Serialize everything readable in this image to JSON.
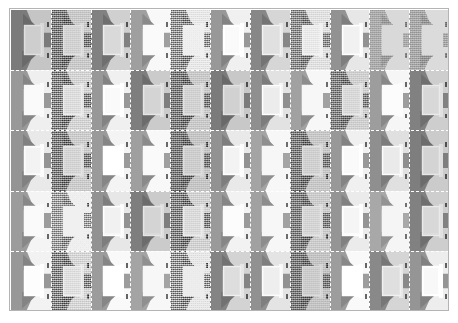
{
  "figure": {
    "type": "image-grid-montage",
    "rows": 5,
    "columns": 11,
    "total_tiles": 55,
    "frame_color": "#b4b4b4",
    "separator_color": "#ffffff",
    "separator_style": "dashed",
    "background_color": "#ffffff",
    "colorspace": "grayscale",
    "scene_description": "repeated indoor scene patch: bright rectangular panel on gray wall with light wedges and sloped shadows"
  },
  "tiles": [
    [
      {
        "brightness": 0.86,
        "contrast": 1.04,
        "noise": 0.0
      },
      {
        "brightness": 0.92,
        "contrast": 0.92,
        "noise": 0.85
      },
      {
        "brightness": 0.9,
        "contrast": 1.06,
        "noise": 0.0
      },
      {
        "brightness": 1.12,
        "contrast": 0.96,
        "noise": 0.0
      },
      {
        "brightness": 1.1,
        "contrast": 0.88,
        "noise": 0.8
      },
      {
        "brightness": 1.06,
        "contrast": 1.0,
        "noise": 0.0
      },
      {
        "brightness": 0.94,
        "contrast": 1.02,
        "noise": 0.0
      },
      {
        "brightness": 1.04,
        "contrast": 0.9,
        "noise": 0.7
      },
      {
        "brightness": 1.02,
        "contrast": 1.0,
        "noise": 0.0
      },
      {
        "brightness": 1.34,
        "contrast": 0.7,
        "noise": 0.25
      },
      {
        "brightness": 1.3,
        "contrast": 0.72,
        "noise": 0.3
      }
    ],
    [
      {
        "brightness": 1.08,
        "contrast": 0.96,
        "noise": 0.0
      },
      {
        "brightness": 0.98,
        "contrast": 0.9,
        "noise": 0.88
      },
      {
        "brightness": 1.06,
        "contrast": 1.0,
        "noise": 0.0
      },
      {
        "brightness": 0.88,
        "contrast": 1.06,
        "noise": 0.0
      },
      {
        "brightness": 0.92,
        "contrast": 0.92,
        "noise": 0.82
      },
      {
        "brightness": 0.86,
        "contrast": 1.08,
        "noise": 0.0
      },
      {
        "brightness": 1.0,
        "contrast": 1.0,
        "noise": 0.0
      },
      {
        "brightness": 1.14,
        "contrast": 0.94,
        "noise": 0.0
      },
      {
        "brightness": 0.96,
        "contrast": 0.9,
        "noise": 0.75
      },
      {
        "brightness": 1.1,
        "contrast": 0.98,
        "noise": 0.0
      },
      {
        "brightness": 0.9,
        "contrast": 1.04,
        "noise": 0.0
      }
    ],
    [
      {
        "brightness": 1.04,
        "contrast": 0.98,
        "noise": 0.0
      },
      {
        "brightness": 0.94,
        "contrast": 0.9,
        "noise": 0.86
      },
      {
        "brightness": 1.08,
        "contrast": 1.0,
        "noise": 0.0
      },
      {
        "brightness": 1.12,
        "contrast": 0.96,
        "noise": 0.0
      },
      {
        "brightness": 0.9,
        "contrast": 0.92,
        "noise": 0.78
      },
      {
        "brightness": 1.02,
        "contrast": 1.02,
        "noise": 0.0
      },
      {
        "brightness": 1.16,
        "contrast": 0.94,
        "noise": 0.0
      },
      {
        "brightness": 0.92,
        "contrast": 0.9,
        "noise": 0.8
      },
      {
        "brightness": 1.06,
        "contrast": 1.0,
        "noise": 0.0
      },
      {
        "brightness": 1.0,
        "contrast": 0.98,
        "noise": 0.0
      },
      {
        "brightness": 0.88,
        "contrast": 1.06,
        "noise": 0.0
      }
    ],
    [
      {
        "brightness": 1.1,
        "contrast": 0.96,
        "noise": 0.0
      },
      {
        "brightness": 1.18,
        "contrast": 0.88,
        "noise": 0.7
      },
      {
        "brightness": 1.02,
        "contrast": 1.0,
        "noise": 0.0
      },
      {
        "brightness": 0.88,
        "contrast": 1.06,
        "noise": 0.0
      },
      {
        "brightness": 0.96,
        "contrast": 0.92,
        "noise": 0.84
      },
      {
        "brightness": 1.08,
        "contrast": 0.98,
        "noise": 0.0
      },
      {
        "brightness": 1.14,
        "contrast": 0.94,
        "noise": 0.0
      },
      {
        "brightness": 0.94,
        "contrast": 0.9,
        "noise": 0.76
      },
      {
        "brightness": 1.04,
        "contrast": 1.0,
        "noise": 0.0
      },
      {
        "brightness": 1.2,
        "contrast": 0.92,
        "noise": 0.0
      },
      {
        "brightness": 0.9,
        "contrast": 1.04,
        "noise": 0.0
      }
    ],
    [
      {
        "brightness": 1.06,
        "contrast": 1.02,
        "noise": 0.0
      },
      {
        "brightness": 1.0,
        "contrast": 0.88,
        "noise": 0.9
      },
      {
        "brightness": 1.08,
        "contrast": 1.04,
        "noise": 0.0
      },
      {
        "brightness": 1.16,
        "contrast": 0.94,
        "noise": 0.0
      },
      {
        "brightness": 1.12,
        "contrast": 0.86,
        "noise": 0.88
      },
      {
        "brightness": 0.92,
        "contrast": 1.04,
        "noise": 0.0
      },
      {
        "brightness": 1.02,
        "contrast": 0.98,
        "noise": 0.0
      },
      {
        "brightness": 0.9,
        "contrast": 0.9,
        "noise": 0.78
      },
      {
        "brightness": 1.1,
        "contrast": 1.0,
        "noise": 0.0
      },
      {
        "brightness": 0.96,
        "contrast": 0.96,
        "noise": 0.0
      },
      {
        "brightness": 1.04,
        "contrast": 1.02,
        "noise": 0.0
      }
    ]
  ]
}
